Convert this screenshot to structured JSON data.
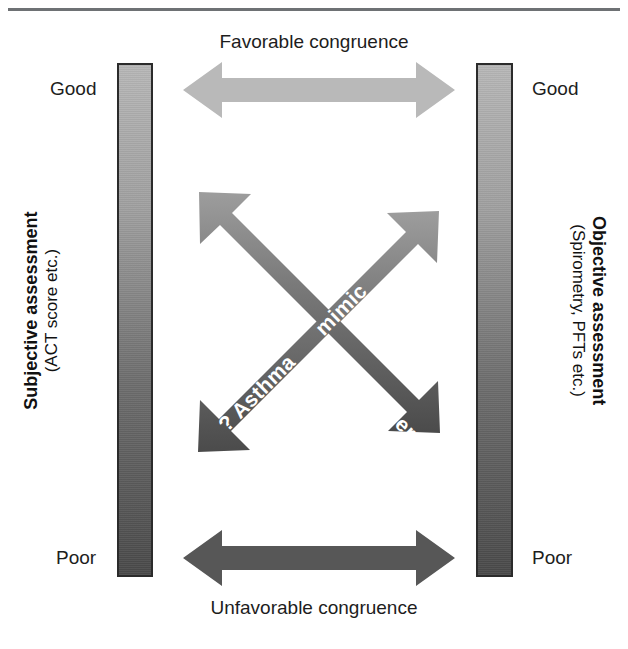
{
  "figure": {
    "width": 628,
    "height": 649,
    "background": "#ffffff"
  },
  "top_rule": {
    "color": "#6e7174"
  },
  "axes": {
    "left": {
      "title": "Subjective assessment",
      "subtitle": "(ACT score etc.)",
      "top_label": "Good",
      "bottom_label": "Poor",
      "gradient_top_color": "#b7b7b7",
      "gradient_bottom_color": "#4a4a4a",
      "border_color": "#2b2b2b"
    },
    "right": {
      "title": "Objective assessment",
      "subtitle": "(Spirometry, PFTs etc.)",
      "top_label": "Good",
      "bottom_label": "Poor",
      "gradient_top_color": "#b7b7b7",
      "gradient_bottom_color": "#4a4a4a",
      "border_color": "#2b2b2b"
    }
  },
  "horizontal_arrows": [
    {
      "id": "favorable",
      "caption": "Favorable congruence",
      "color": "#b9b9b9",
      "position": "top"
    },
    {
      "id": "unfavorable",
      "caption": "Unfavorable congruence",
      "color": "#575757",
      "position": "bottom"
    }
  ],
  "diagonal_arrows": [
    {
      "id": "poor-perceiver",
      "label_upper": "? Poor",
      "label_lower": "perceiver",
      "direction": "nw-se",
      "gradient_light_color": "#9a9a9a",
      "gradient_dark_color": "#4d4d4d",
      "text_color": "#ffffff"
    },
    {
      "id": "asthma-mimic",
      "label_upper": "mimic",
      "label_lower": "? Asthma",
      "direction": "ne-sw",
      "gradient_light_color": "#9a9a9a",
      "gradient_dark_color": "#4d4d4d",
      "text_color": "#ffffff"
    }
  ]
}
